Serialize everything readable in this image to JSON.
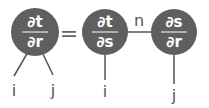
{
  "diagram": {
    "nodes": [
      {
        "id": "lhs",
        "numerator": "∂t",
        "denominator": "∂r"
      },
      {
        "id": "mid",
        "numerator": "∂t",
        "denominator": "∂s"
      },
      {
        "id": "rhs",
        "numerator": "∂s",
        "denominator": "∂r"
      }
    ],
    "equals": "=",
    "edge_label": "n",
    "legs": {
      "lhs_left": "i",
      "lhs_right": "j",
      "mid": "i",
      "rhs": "j"
    },
    "colors": {
      "node": "#5f5f5f",
      "line": "#555555",
      "text": "#555555"
    }
  }
}
